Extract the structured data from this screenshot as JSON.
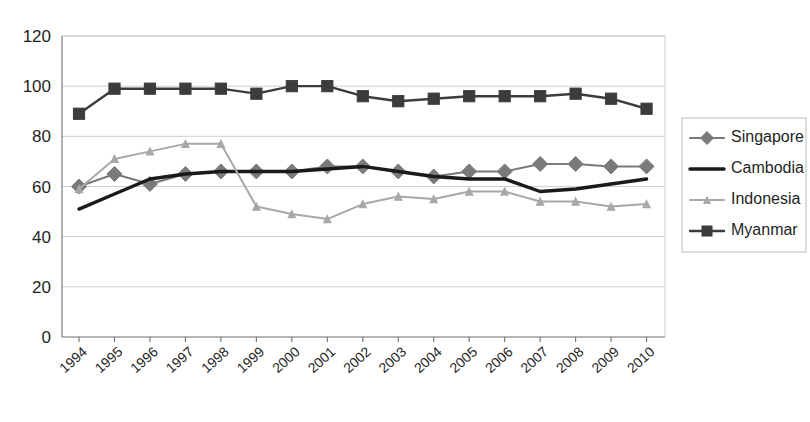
{
  "chart_data": {
    "type": "line",
    "title": "",
    "subtitle": "",
    "xlabel": "",
    "ylabel": "",
    "grid": true,
    "legend_position": "right",
    "xlim": [
      1994,
      2010
    ],
    "ylim": [
      0,
      120
    ],
    "ytick_step": 20,
    "yticks": [
      "0",
      "20",
      "40",
      "60",
      "80",
      "100",
      "120"
    ],
    "categories": [
      "1994",
      "1995",
      "1996",
      "1997",
      "1998",
      "1999",
      "2000",
      "2001",
      "2002",
      "2003",
      "2004",
      "2005",
      "2006",
      "2007",
      "2008",
      "2009",
      "2010"
    ],
    "series": [
      {
        "name": "Singapore",
        "color": "#7a7a7a",
        "marker": "diamond",
        "line_width": 2,
        "values": [
          60,
          65,
          61,
          65,
          66,
          66,
          66,
          68,
          68,
          66,
          64,
          66,
          66,
          69,
          69,
          68,
          68
        ]
      },
      {
        "name": "Cambodia",
        "color": "#1a1a1a",
        "marker": "none",
        "line_width": 3.4,
        "values": [
          51,
          57,
          63,
          65,
          66,
          66,
          66,
          67,
          68,
          66,
          64,
          63,
          63,
          58,
          59,
          61,
          63
        ]
      },
      {
        "name": "Indonesia",
        "color": "#a8a8a8",
        "marker": "small-triangle",
        "line_width": 2,
        "values": [
          59,
          71,
          74,
          77,
          77,
          52,
          49,
          47,
          53,
          56,
          55,
          58,
          58,
          54,
          54,
          52,
          53
        ]
      },
      {
        "name": "Myanmar",
        "color": "#3c3c3c",
        "marker": "square",
        "line_width": 2.4,
        "values": [
          89,
          99,
          99,
          99,
          99,
          97,
          100,
          100,
          96,
          94,
          95,
          96,
          96,
          96,
          97,
          95,
          91
        ]
      }
    ]
  },
  "legend": {
    "items": [
      {
        "label": "Singapore"
      },
      {
        "label": "Cambodia"
      },
      {
        "label": "Indonesia"
      },
      {
        "label": "Myanmar"
      }
    ]
  }
}
